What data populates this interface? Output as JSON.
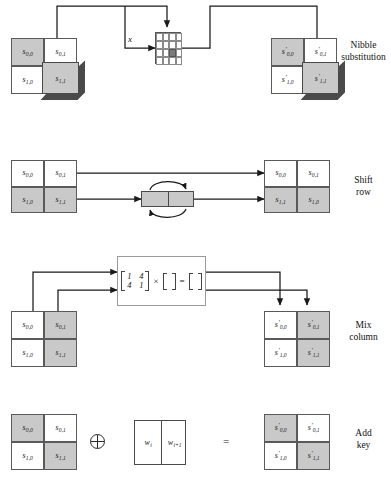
{
  "figure": {
    "stages": [
      {
        "id": "nibble-substitution",
        "caption_line1": "Nibble",
        "caption_line2": "substitution"
      },
      {
        "id": "shift-row",
        "caption_line1": "Shift",
        "caption_line2": "row"
      },
      {
        "id": "mix-column",
        "caption_line1": "Mix",
        "caption_line2": "column"
      },
      {
        "id": "add-key",
        "caption_line1": "Add",
        "caption_line2": "key"
      }
    ]
  },
  "symbols": {
    "sbox_input_label": "x",
    "xor": "⊕",
    "equals": "=",
    "times": "×"
  },
  "nibble_substitution": {
    "input_state": {
      "cells": [
        {
          "base": "s",
          "sub": "0,0",
          "prime": false,
          "shaded": true,
          "cube": false
        },
        {
          "base": "s",
          "sub": "0,1",
          "prime": false,
          "shaded": false,
          "cube": false
        },
        {
          "base": "s",
          "sub": "1,0",
          "prime": false,
          "shaded": false,
          "cube": false
        },
        {
          "base": "s",
          "sub": "1,1",
          "prime": false,
          "shaded": true,
          "cube": true
        }
      ]
    },
    "output_state": {
      "cells": [
        {
          "base": "s",
          "sub": "0,0",
          "prime": true,
          "shaded": true,
          "cube": false
        },
        {
          "base": "s",
          "sub": "0,1",
          "prime": true,
          "shaded": false,
          "cube": false
        },
        {
          "base": "s",
          "sub": "1,0",
          "prime": true,
          "shaded": false,
          "cube": false
        },
        {
          "base": "s",
          "sub": "1,1",
          "prime": true,
          "shaded": true,
          "cube": true
        }
      ]
    },
    "sbox": {
      "rows": 4,
      "cols": 4,
      "highlighted_cell": {
        "row": 2,
        "col": 2
      }
    }
  },
  "shift_row": {
    "input_state": {
      "cells": [
        {
          "base": "s",
          "sub": "0,0",
          "prime": false,
          "shaded": false
        },
        {
          "base": "s",
          "sub": "0,1",
          "prime": false,
          "shaded": false
        },
        {
          "base": "s",
          "sub": "1,0",
          "prime": false,
          "shaded": true
        },
        {
          "base": "s",
          "sub": "1,1",
          "prime": false,
          "shaded": true
        }
      ]
    },
    "output_state": {
      "cells": [
        {
          "base": "s",
          "sub": "0,0",
          "prime": false,
          "shaded": false
        },
        {
          "base": "s",
          "sub": "0,1",
          "prime": false,
          "shaded": false
        },
        {
          "base": "s",
          "sub": "1,1",
          "prime": false,
          "shaded": true
        },
        {
          "base": "s",
          "sub": "1,0",
          "prime": false,
          "shaded": true
        }
      ]
    },
    "swap_widget": {
      "cells": 2,
      "shaded": true,
      "rotate_arrows": true
    }
  },
  "mix_column": {
    "input_state": {
      "cells": [
        {
          "base": "s",
          "sub": "0,0",
          "prime": false,
          "shaded": false
        },
        {
          "base": "s",
          "sub": "0,1",
          "prime": false,
          "shaded": true
        },
        {
          "base": "s",
          "sub": "1,0",
          "prime": false,
          "shaded": false
        },
        {
          "base": "s",
          "sub": "1,1",
          "prime": false,
          "shaded": true
        }
      ]
    },
    "output_state": {
      "cells": [
        {
          "base": "s",
          "sub": "0,0",
          "prime": true,
          "shaded": false
        },
        {
          "base": "s",
          "sub": "0,1",
          "prime": true,
          "shaded": true
        },
        {
          "base": "s",
          "sub": "1,0",
          "prime": true,
          "shaded": false
        },
        {
          "base": "s",
          "sub": "1,1",
          "prime": true,
          "shaded": true
        }
      ]
    },
    "matrix": {
      "r0c0": "1",
      "r0c1": "4",
      "r1c0": "4",
      "r1c1": "1"
    }
  },
  "add_key": {
    "input_state": {
      "cells": [
        {
          "base": "s",
          "sub": "0,0",
          "prime": false,
          "shaded": true
        },
        {
          "base": "s",
          "sub": "0,1",
          "prime": false,
          "shaded": false
        },
        {
          "base": "s",
          "sub": "1,0",
          "prime": false,
          "shaded": false
        },
        {
          "base": "s",
          "sub": "1,1",
          "prime": false,
          "shaded": true
        }
      ]
    },
    "output_state": {
      "cells": [
        {
          "base": "s",
          "sub": "0,0",
          "prime": true,
          "shaded": true
        },
        {
          "base": "s",
          "sub": "0,1",
          "prime": true,
          "shaded": false
        },
        {
          "base": "s",
          "sub": "1,0",
          "prime": true,
          "shaded": false
        },
        {
          "base": "s",
          "sub": "1,1",
          "prime": true,
          "shaded": true
        }
      ]
    },
    "key_words": [
      {
        "base": "w",
        "sub": "i"
      },
      {
        "base": "w",
        "sub": "i+1"
      }
    ]
  },
  "colors": {
    "shaded_cell": "#c9c9c9",
    "cell_border": "#5a5a5a",
    "line": "#1a1a1a",
    "sbox_highlight": "#7b7b7b",
    "cube_side": "#4a4a4a",
    "background": "#ffffff"
  }
}
